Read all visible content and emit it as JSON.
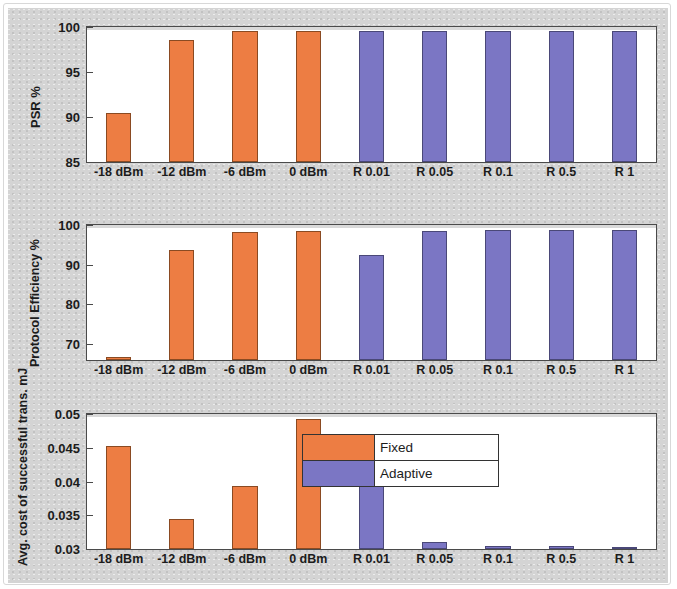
{
  "figure": {
    "background_color": "#d4d4d4",
    "plot_background": "#ffffff"
  },
  "legend": {
    "position": "bottom-panel-upper-right",
    "entries": [
      {
        "label": "Fixed",
        "color": "#ED7D43"
      },
      {
        "label": "Adaptive",
        "color": "#7B76C4"
      }
    ]
  },
  "chart_data": [
    {
      "type": "bar",
      "title": "",
      "xlabel": "",
      "ylabel": "PSR %",
      "ylim": [
        85,
        100
      ],
      "yticks": [
        "85",
        "90",
        "95",
        "100"
      ],
      "ytick_values": [
        85,
        90,
        95,
        100
      ],
      "grid": false,
      "categories": [
        "-18 dBm",
        "-12 dBm",
        "-6 dBm",
        "0 dBm",
        "R 0.01",
        "R 0.05",
        "R 0.1",
        "R 0.5",
        "R 1"
      ],
      "values": [
        90.4,
        98.6,
        99.6,
        99.6,
        99.6,
        99.6,
        99.6,
        99.6,
        99.6
      ],
      "bar_groups": [
        "Fixed",
        "Fixed",
        "Fixed",
        "Fixed",
        "Adaptive",
        "Adaptive",
        "Adaptive",
        "Adaptive",
        "Adaptive"
      ]
    },
    {
      "type": "bar",
      "title": "",
      "xlabel": "",
      "ylabel": "Protocol Efficiency %",
      "ylim": [
        66,
        100
      ],
      "yticks": [
        "70",
        "80",
        "90",
        "100"
      ],
      "ytick_values": [
        70,
        80,
        90,
        100
      ],
      "grid": false,
      "categories": [
        "-18 dBm",
        "-12 dBm",
        "-6 dBm",
        "0 dBm",
        "R 0.01",
        "R 0.05",
        "R 0.1",
        "R 0.5",
        "R 1"
      ],
      "values": [
        66.8,
        93.8,
        98.3,
        98.6,
        92.5,
        98.5,
        98.7,
        98.7,
        98.7
      ],
      "bar_groups": [
        "Fixed",
        "Fixed",
        "Fixed",
        "Fixed",
        "Adaptive",
        "Adaptive",
        "Adaptive",
        "Adaptive",
        "Adaptive"
      ]
    },
    {
      "type": "bar",
      "title": "",
      "xlabel": "",
      "ylabel": "Avg. cost of successful trans. mJ",
      "ylim": [
        0.03,
        0.05
      ],
      "yticks": [
        "0.03",
        "0.035",
        "0.04",
        "0.045",
        "0.05"
      ],
      "ytick_values": [
        0.03,
        0.035,
        0.04,
        0.045,
        0.05
      ],
      "grid": false,
      "categories": [
        "-18 dBm",
        "-12 dBm",
        "-6 dBm",
        "0 dBm",
        "R 0.01",
        "R 0.05",
        "R 0.1",
        "R 0.5",
        "R 1"
      ],
      "values": [
        0.0453,
        0.0344,
        0.0393,
        0.0493,
        0.0443,
        0.0311,
        0.0305,
        0.0305,
        0.0303
      ],
      "bar_groups": [
        "Fixed",
        "Fixed",
        "Fixed",
        "Fixed",
        "Adaptive",
        "Adaptive",
        "Adaptive",
        "Adaptive",
        "Adaptive"
      ]
    }
  ]
}
